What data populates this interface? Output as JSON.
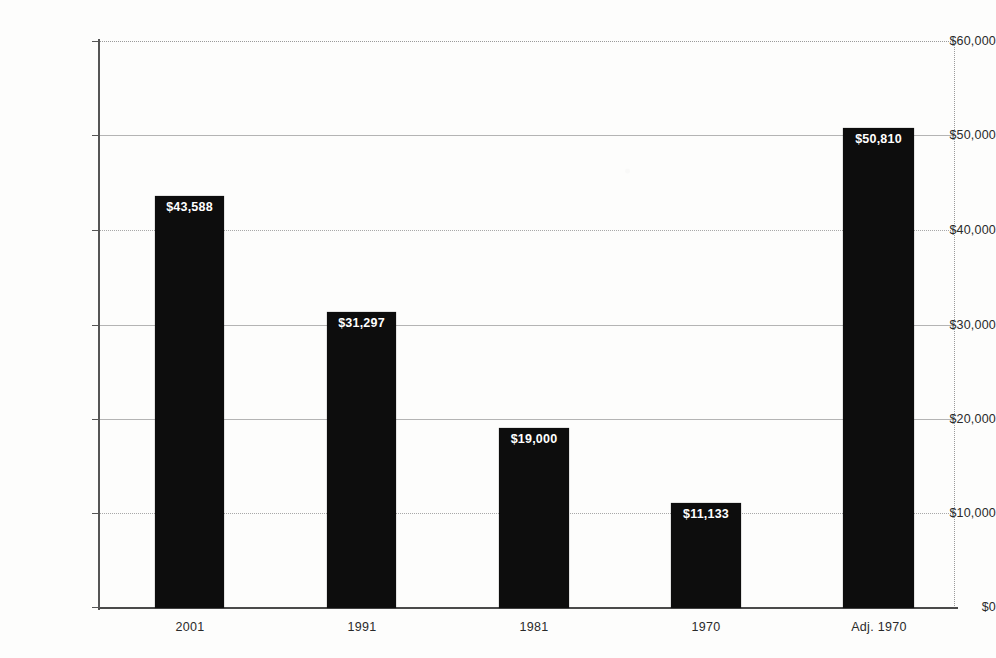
{
  "chart_data": {
    "type": "bar",
    "title": "",
    "xlabel": "",
    "ylabel": "",
    "categories": [
      "2001",
      "1991",
      "1981",
      "1970",
      "Adj. 1970"
    ],
    "values": [
      43588,
      31297,
      19000,
      11133,
      50810
    ],
    "data_labels": [
      "$43,588",
      "$31,297",
      "$19,000",
      "$11,133",
      "$50,810"
    ],
    "ylim": [
      0,
      60000
    ],
    "ytick_values": [
      0,
      10000,
      20000,
      30000,
      40000,
      50000,
      60000
    ],
    "ytick_labels": [
      "$0",
      "$10,000",
      "$20,000",
      "$30,000",
      "$40,000",
      "$50,000",
      "$60,000"
    ],
    "grid": true,
    "legend": false,
    "series": [
      {
        "name": "",
        "values": [
          43588,
          31297,
          19000,
          11133,
          50810
        ],
        "color": "#0d0d0d"
      }
    ],
    "colors": {
      "bar": "#0d0d0d",
      "gridline": "#a8a8a8",
      "axis": "#4a4a4a",
      "label_text": "#2a2a2a",
      "data_label_text": "#ffffff",
      "background": "#fdfdfc"
    }
  }
}
